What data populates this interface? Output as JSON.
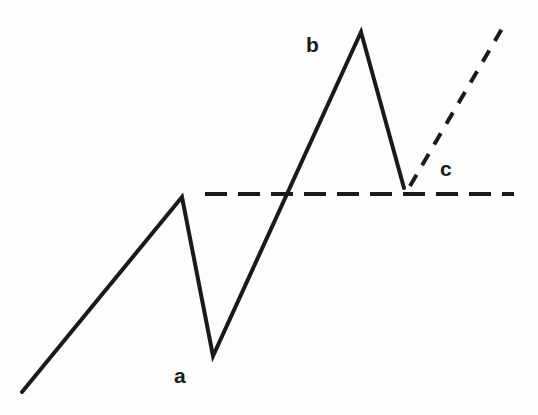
{
  "figure": {
    "background_color": "#fdfdfd",
    "stroke_color": "#1a1a1a",
    "width": 538,
    "height": 415
  },
  "labels": {
    "a": "a",
    "b": "b",
    "c": "c"
  },
  "chart_data": {
    "type": "line",
    "title": "",
    "subtitle": "",
    "xlabel": "",
    "ylabel": "",
    "xlim": [
      0,
      538
    ],
    "ylim": [
      0,
      415
    ],
    "grid": false,
    "legend": false,
    "annotations": [
      {
        "text": "a",
        "x": 182,
        "y": 377,
        "role": "trough-label"
      },
      {
        "text": "b",
        "x": 314,
        "y": 46,
        "role": "peak-label"
      },
      {
        "text": "c",
        "x": 448,
        "y": 170,
        "role": "breakout-label"
      }
    ],
    "series": [
      {
        "name": "price-path",
        "style": "solid",
        "color": "#1a1a1a",
        "width": 4,
        "points": [
          {
            "x": 22,
            "y": 392
          },
          {
            "x": 182,
            "y": 197
          },
          {
            "x": 213,
            "y": 356
          },
          {
            "x": 361,
            "y": 32
          },
          {
            "x": 404,
            "y": 188
          }
        ]
      },
      {
        "name": "support-resistance-level",
        "style": "dashed",
        "color": "#1a1a1a",
        "width": 4,
        "dash": "22 11",
        "points": [
          {
            "x": 205,
            "y": 194
          },
          {
            "x": 514,
            "y": 194
          }
        ]
      },
      {
        "name": "projected-continuation",
        "style": "dashed",
        "color": "#1a1a1a",
        "width": 4,
        "dash": "13 11",
        "points": [
          {
            "x": 410,
            "y": 186
          },
          {
            "x": 503,
            "y": 27
          }
        ]
      }
    ]
  }
}
